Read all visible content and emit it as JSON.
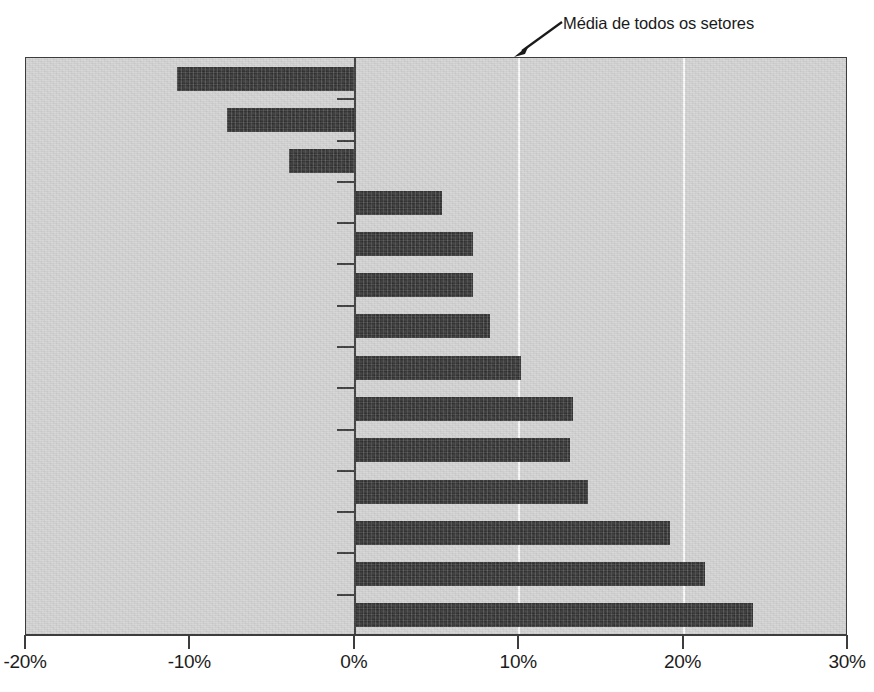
{
  "chart_data": {
    "type": "bar",
    "orientation": "horizontal",
    "title": "",
    "xlabel": "",
    "ylabel": "",
    "xlim": [
      -20,
      30
    ],
    "xticks": [
      -20,
      -10,
      0,
      10,
      20,
      30
    ],
    "xtick_labels": [
      "-20%",
      "-10%",
      "0%",
      "10%",
      "20%",
      "30%"
    ],
    "gridlines": [
      10,
      20
    ],
    "grid": true,
    "legend": false,
    "categories": [
      "Manufatura",
      "Agricultura e mineração",
      "Governo Federal",
      "Varejo e atacado",
      "Estado e governo local",
      "Informação",
      "Transporte e utilidade pública",
      "Construção",
      "Outros serviços",
      "Lazer e hotelaria",
      "Serviços financeiros",
      "Serviços educacionais",
      "Serviços profissionais e empresariais",
      "Assistência médica e social"
    ],
    "values": [
      -10.8,
      -7.8,
      -4.0,
      5.3,
      7.2,
      7.2,
      8.2,
      10.1,
      13.3,
      13.1,
      14.2,
      19.2,
      21.3,
      24.2
    ],
    "annotations": [
      {
        "text": "Média de todos os setores",
        "points_to_x": 10,
        "name": "average-all-sectors-annotation"
      }
    ],
    "colors": {
      "bar": "#3a3a3a",
      "plot_background": "#d5d5d5",
      "gridline": "#fdfdfd",
      "axis": "#3d3d3d",
      "text": "#1c1c1c"
    }
  }
}
